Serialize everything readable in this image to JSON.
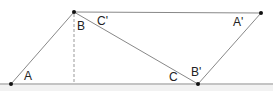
{
  "diagram": {
    "type": "geometry",
    "points": {
      "A": {
        "label": "A",
        "x": 11,
        "y": 84
      },
      "B": {
        "label": "B",
        "x": 74,
        "y": 12
      },
      "A_prime": {
        "label": "A'",
        "x": 261,
        "y": 13
      },
      "B_prime": {
        "label": "B'",
        "x": 198,
        "y": 84
      }
    },
    "labels": {
      "A": "A",
      "B": "B",
      "C": "C",
      "C_prime": "C'",
      "A_prime": "A'",
      "B_prime": "B'"
    },
    "colors": {
      "line": "#888888",
      "point": "#111111",
      "baseline_band": "#f2f2f2"
    }
  }
}
